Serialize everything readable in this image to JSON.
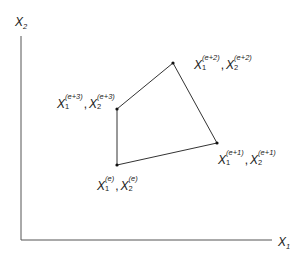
{
  "axes": {
    "x_label": "X",
    "x_sub": "1",
    "y_label": "X",
    "y_sub": "2"
  },
  "points": [
    {
      "id": "e",
      "var": "X",
      "sub1": "1",
      "sub2": "2",
      "sup": "(e)",
      "x": 117,
      "y": 165
    },
    {
      "id": "e+1",
      "var": "X",
      "sub1": "1",
      "sub2": "2",
      "sup": "(e+1)",
      "x": 217,
      "y": 143
    },
    {
      "id": "e+2",
      "var": "X",
      "sub1": "1",
      "sub2": "2",
      "sup": "(e+2)",
      "x": 173,
      "y": 63
    },
    {
      "id": "e+3",
      "var": "X",
      "sub1": "1",
      "sub2": "2",
      "sup": "(e+3)",
      "x": 117,
      "y": 109
    }
  ],
  "colors": {
    "line": "#333333",
    "point": "#111111",
    "text": "#222222"
  }
}
